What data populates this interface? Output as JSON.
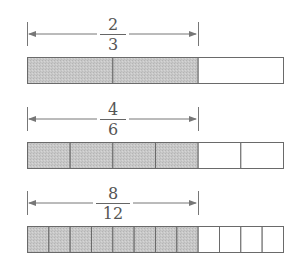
{
  "colors": {
    "shaded": "#c8c8c8",
    "outline": "#6a6a6a",
    "arrow": "#777777",
    "text": "#555555"
  },
  "bar_geometry": {
    "x_left": 27,
    "x_right": 283,
    "x_shaded_end": 198
  },
  "rows": [
    {
      "numerator": "2",
      "denominator": "3",
      "parts": 3,
      "shaded": 2,
      "arrow_y": 34,
      "bar_top": 57,
      "bar_height": 26,
      "label_top": 16
    },
    {
      "numerator": "4",
      "denominator": "6",
      "parts": 6,
      "shaded": 4,
      "arrow_y": 119,
      "bar_top": 142,
      "bar_height": 26,
      "label_top": 101
    },
    {
      "numerator": "8",
      "denominator": "12",
      "parts": 12,
      "shaded": 8,
      "arrow_y": 203,
      "bar_top": 226,
      "bar_height": 26,
      "label_top": 185
    }
  ]
}
